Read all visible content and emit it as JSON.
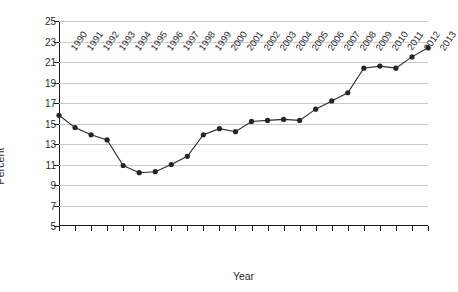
{
  "chart_data": {
    "type": "line",
    "title": "",
    "xlabel": "Year",
    "ylabel": "Percent",
    "categories": [
      "1990",
      "1991",
      "1992",
      "1993",
      "1994",
      "1995",
      "1996",
      "1997",
      "1998",
      "1999",
      "2000",
      "2001",
      "2002",
      "2003",
      "2004",
      "2005",
      "2006",
      "2007",
      "2008",
      "2009",
      "2010",
      "2011",
      "2012",
      "2013"
    ],
    "values": [
      15.8,
      14.6,
      13.9,
      13.4,
      10.9,
      10.2,
      10.3,
      11.0,
      11.8,
      13.9,
      14.5,
      14.2,
      15.2,
      15.3,
      15.4,
      15.3,
      16.4,
      17.2,
      18.0,
      20.4,
      20.6,
      20.4,
      21.5,
      22.4
    ],
    "ylim": [
      5,
      25
    ],
    "yticks": [
      5,
      7,
      9,
      11,
      13,
      15,
      17,
      19,
      21,
      23,
      25
    ],
    "ytick_labels": [
      "5",
      "7",
      "9",
      "11",
      "13",
      "15",
      "17",
      "19",
      "21",
      "23",
      "25"
    ],
    "grid": "horizontal",
    "legend": "none",
    "series_color": "#262626",
    "grid_color": "#c9c9c9",
    "axis_color": "#1a1a1a",
    "marker": "filled-circle"
  }
}
